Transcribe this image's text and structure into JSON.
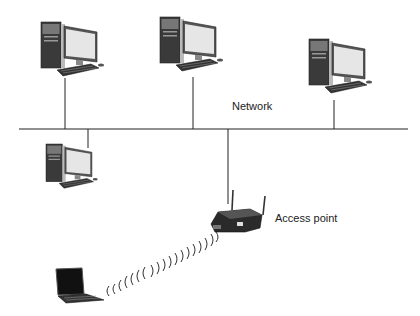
{
  "diagram": {
    "labels": {
      "network": "Network",
      "access_point": "Access point"
    },
    "nodes": [
      {
        "id": "desktop-1",
        "type": "desktop-computer"
      },
      {
        "id": "desktop-2",
        "type": "desktop-computer"
      },
      {
        "id": "desktop-3",
        "type": "desktop-computer"
      },
      {
        "id": "desktop-4",
        "type": "desktop-computer"
      },
      {
        "id": "access-point",
        "type": "wireless-router"
      },
      {
        "id": "laptop",
        "type": "laptop-computer"
      }
    ],
    "edges": [
      {
        "from": "desktop-1",
        "to": "network",
        "kind": "wired"
      },
      {
        "from": "desktop-2",
        "to": "network",
        "kind": "wired"
      },
      {
        "from": "desktop-3",
        "to": "network",
        "kind": "wired"
      },
      {
        "from": "desktop-4",
        "to": "network",
        "kind": "wired"
      },
      {
        "from": "access-point",
        "to": "network",
        "kind": "wired"
      },
      {
        "from": "laptop",
        "to": "access-point",
        "kind": "wireless"
      }
    ]
  }
}
